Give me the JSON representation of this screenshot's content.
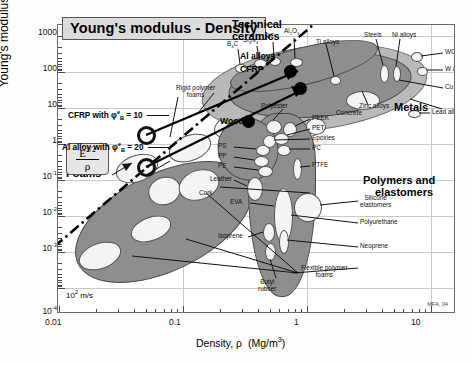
{
  "chart_data": {
    "type": "scatter",
    "title": "Young's modulus - Density",
    "xlabel": "Density, ρ  (Mg/m³)",
    "ylabel": "Young's modulus, E (GPa)",
    "xscale": "log",
    "yscale": "log",
    "xlim": [
      0.01,
      30
    ],
    "ylim": [
      0.0001,
      3000
    ],
    "xticks": [
      "0.01",
      "0.1",
      "1",
      "10"
    ],
    "yticks": [
      "1000",
      "100",
      "10",
      "1",
      "10⁻¹",
      "10⁻²",
      "10⁻³",
      "10⁻⁴"
    ],
    "grid": true,
    "legend": "none",
    "guideline_label": "E^(1/2) / ρ",
    "guideline_note": "10² m/s",
    "signature": "MFA, 04",
    "families": [
      {
        "name": "Technical ceramics",
        "label": "Technical ceramics"
      },
      {
        "name": "Metals",
        "label": "Metals"
      },
      {
        "name": "Polymers and elastomers",
        "label": "Polymers and elastomers"
      },
      {
        "name": "Foams",
        "label": "Foams"
      },
      {
        "name": "Composites",
        "label": "CFRP"
      }
    ],
    "markers": [
      {
        "label": "CFRP",
        "type": "filled-dot"
      },
      {
        "label": "Al alloys",
        "type": "filled-dot"
      },
      {
        "label": "Wood",
        "type": "filled-dot"
      },
      {
        "label": "CFRP with φ = 10",
        "type": "ring"
      },
      {
        "label": "Al alloy with φ = 20",
        "type": "ring"
      }
    ],
    "material_labels": [
      "SiC",
      "Al₂O₃",
      "Si₃N₄",
      "B₄C",
      "Ti alloys",
      "Steels",
      "Ni alloys",
      "WC",
      "W alloys",
      "Cu alloys",
      "Zinc alloys",
      "Lead alloys",
      "Polyester",
      "PEEK",
      "Concrete",
      "PET",
      "Epoxies",
      "PC",
      "PS",
      "PP",
      "PE",
      "Leather",
      "PTFE",
      "EVA",
      "Silicone elastomers",
      "Polyurethane",
      "Isoprene",
      "Neoprene",
      "Butyl rubber",
      "Cork",
      "Rigid polymer foams",
      "Flexible polymer foams"
    ]
  },
  "title": "Young's modulus - Density",
  "axes": {
    "ylabel": "Young's modulus, E (GPa)",
    "xlabel_density": "Density, ",
    "xlabel_rho": "ρ",
    "xlabel_units": "(Mg/m",
    "xlabel_units_end": ")",
    "y": {
      "t1000": "1000",
      "t100": "100",
      "t10": "10",
      "t1": "1",
      "tm1_base": "10",
      "tm1_exp": "-1",
      "tm2_base": "10",
      "tm2_exp": "-2",
      "tm3_base": "10",
      "tm3_exp": "-3",
      "tm4_base": "10",
      "tm4_exp": "-4"
    },
    "x": {
      "t001": "0.01",
      "t01": "0.1",
      "t1": "1",
      "t10": "10"
    }
  },
  "families": {
    "technical_ceramics": "Technical\nceramics",
    "technical_ceramics_l1": "Technical",
    "technical_ceramics_l2": "ceramics",
    "metals": "Metals",
    "polymers_l1": "Polymers and",
    "polymers_l2": "elastomers",
    "foams": "Foams",
    "al_alloys": "Al alloys",
    "cfrp": "CFRP",
    "wood": "Wood"
  },
  "guideline": {
    "numerator": "E",
    "numerator_exp": "1/2",
    "denominator": "ρ",
    "speed_base": "10",
    "speed_exp": "2",
    "speed_unit": " m/s"
  },
  "annotations": {
    "cfrp_phi_pre": "CFRP with ",
    "cfrp_phi_sym": "φ",
    "cfrp_phi_sub": "B",
    "cfrp_phi_sup": "e",
    "cfrp_phi_val": " = 10",
    "al_phi_pre": "Al alloy with ",
    "al_phi_sym": "φ",
    "al_phi_sub": "B",
    "al_phi_sup": "e",
    "al_phi_val": " = 20"
  },
  "materials": {
    "sic": "SiC",
    "al2o3_pre": "Al",
    "al2o3_sub1": "2",
    "al2o3_mid": "O",
    "al2o3_sub2": "3",
    "si3n4_pre": "Si",
    "si3n4_sub1": "3",
    "si3n4_mid": "N",
    "si3n4_sub2": "4",
    "b4c_pre": "B",
    "b4c_sub": "4",
    "b4c_post": "C",
    "ti_alloys": "Ti alloys",
    "steels": "Steels",
    "ni_alloys": "Ni alloys",
    "wc": "WC",
    "w_alloys": "W alloys",
    "cu_alloys": "Cu alloys",
    "zinc_alloys": "Zinc alloys",
    "lead_alloys": "Lead alloys",
    "polyester": "Polyester",
    "peek": "PEEK",
    "concrete": "Concrete",
    "pet": "PET",
    "epoxies": "Epoxies",
    "pc": "PC",
    "ps": "PS",
    "pp": "PP",
    "pe": "PE",
    "leather": "Leather",
    "ptfe": "PTFE",
    "eva": "EVA",
    "silicone_l1": "Silicone",
    "silicone_l2": "elastomers",
    "polyurethane": "Polyurethane",
    "isoprene": "Isoprene",
    "neoprene": "Neoprene",
    "butyl_l1": "Butyl",
    "butyl_l2": "rubber",
    "cork": "Cork",
    "rigid_foams_l1": "Rigid polymer",
    "rigid_foams_l2": "foams",
    "flex_foams_l1": "Flexible polymer",
    "flex_foams_l2": "foams"
  },
  "signature": "MFA, 04"
}
